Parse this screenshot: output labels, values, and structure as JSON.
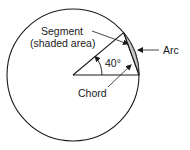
{
  "diagram": {
    "type": "circle-segment",
    "colors": {
      "stroke": "#1a1a1a",
      "segment_fill": "#c8c8c8",
      "background": "#ffffff"
    },
    "circle": {
      "cx": 73,
      "cy": 75,
      "r": 66
    },
    "angle_deg": 40,
    "labels": {
      "segment_line1": "Segment",
      "segment_line2": "(shaded area)",
      "angle": "40°",
      "arc": "Arc",
      "chord": "Chord"
    }
  }
}
